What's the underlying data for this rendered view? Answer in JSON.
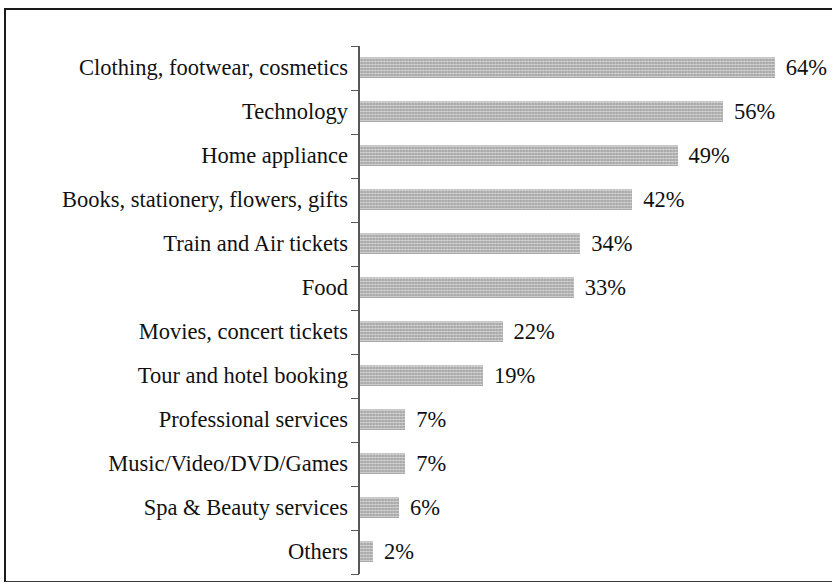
{
  "figure": {
    "title": "",
    "border_color": "#1a1a1a",
    "background": "#ffffff"
  },
  "axis": {
    "line_color": "#585858",
    "tick_count": 13
  },
  "bar_style": {
    "fill": "#b9b9b9",
    "texture": "dithered-gray-halftone"
  },
  "chart_data": {
    "type": "bar",
    "orientation": "horizontal",
    "title": "",
    "subtitle": "",
    "xlabel": "",
    "ylabel": "",
    "grid": false,
    "legend": null,
    "value_suffix": "%",
    "xlim": [
      0,
      70
    ],
    "categories": [
      "Clothing, footwear, cosmetics",
      "Technology",
      "Home appliance",
      "Books, stationery, flowers, gifts",
      "Train and Air tickets",
      "Food",
      "Movies, concert tickets",
      "Tour and hotel booking",
      "Professional services",
      "Music/Video/DVD/Games",
      "Spa & Beauty services",
      "Others"
    ],
    "values": [
      64,
      56,
      49,
      42,
      34,
      33,
      22,
      19,
      7,
      7,
      6,
      2
    ],
    "data_labels": [
      "64%",
      "56%",
      "49%",
      "42%",
      "34%",
      "33%",
      "22%",
      "19%",
      "7%",
      "7%",
      "6%",
      "2%"
    ]
  }
}
